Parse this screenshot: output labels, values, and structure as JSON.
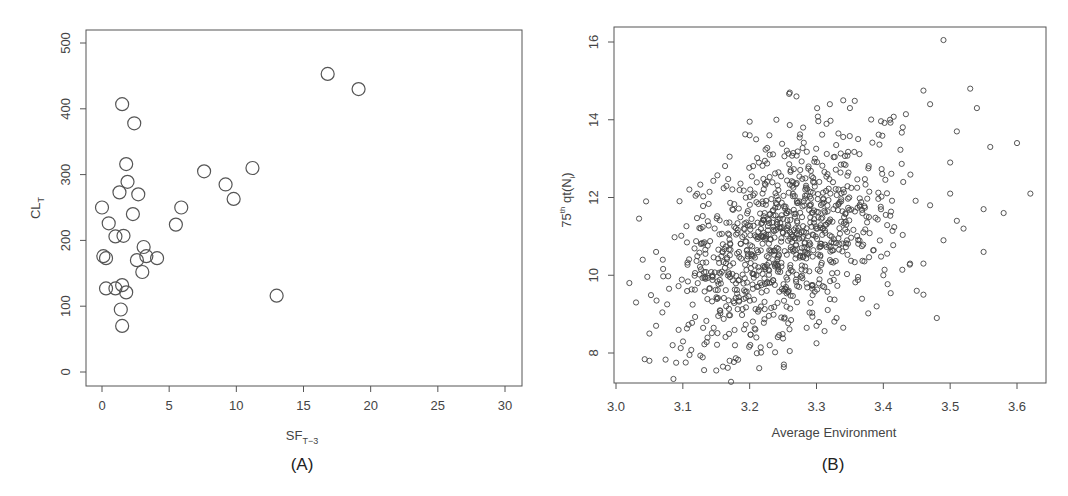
{
  "chart_data": [
    {
      "type": "scatter",
      "panel_label": "(A)",
      "title": "",
      "xlabel": "SF",
      "xlabel_sub": "T−3",
      "ylabel": "CL",
      "ylabel_sub": "T",
      "xlim": [
        -1,
        31.5
      ],
      "ylim": [
        -20,
        520
      ],
      "xticks": [
        0,
        5,
        10,
        15,
        20,
        25,
        30
      ],
      "yticks": [
        0,
        100,
        200,
        300,
        400,
        500
      ],
      "grid": false,
      "legend": null,
      "marker": "open-circle-large",
      "points": [
        [
          16.8,
          453
        ],
        [
          19.1,
          430
        ],
        [
          1.5,
          407
        ],
        [
          2.4,
          378
        ],
        [
          1.8,
          316
        ],
        [
          7.6,
          305
        ],
        [
          11.2,
          310
        ],
        [
          1.9,
          289
        ],
        [
          9.2,
          285
        ],
        [
          1.3,
          273
        ],
        [
          2.7,
          270
        ],
        [
          9.8,
          263
        ],
        [
          0.0,
          250
        ],
        [
          5.9,
          250
        ],
        [
          2.3,
          240
        ],
        [
          0.5,
          226
        ],
        [
          5.5,
          224
        ],
        [
          1.0,
          206
        ],
        [
          1.6,
          207
        ],
        [
          3.1,
          190
        ],
        [
          0.1,
          176
        ],
        [
          0.3,
          173
        ],
        [
          2.6,
          170
        ],
        [
          3.3,
          176
        ],
        [
          4.1,
          173
        ],
        [
          3.0,
          152
        ],
        [
          0.3,
          127
        ],
        [
          1.0,
          127
        ],
        [
          1.5,
          132
        ],
        [
          1.8,
          121
        ],
        [
          13.0,
          116
        ],
        [
          1.4,
          95
        ],
        [
          1.5,
          70
        ]
      ]
    },
    {
      "type": "scatter",
      "panel_label": "(B)",
      "title": "",
      "xlabel": "Average Environment",
      "ylabel_prefix": "75",
      "ylabel_sup": "th",
      "ylabel_main": " qt(N",
      "ylabel_sub": "i",
      "ylabel_suffix": ")",
      "xlim": [
        2.997,
        3.645
      ],
      "ylim": [
        7.25,
        16.4
      ],
      "xticks": [
        3.0,
        3.1,
        3.2,
        3.3,
        3.4,
        3.5,
        3.6
      ],
      "xtick_labels": [
        "3.0",
        "3.1",
        "3.2",
        "3.3",
        "3.4",
        "3.5",
        "3.6"
      ],
      "yticks": [
        8,
        10,
        12,
        14,
        16
      ],
      "grid": false,
      "legend": null,
      "marker": "open-circle-small",
      "approx_total_points": 1000,
      "cloud_model": {
        "x_mean": 3.255,
        "x_sd": 0.085,
        "y_mean": 10.9,
        "y_sd": 1.35,
        "corr": 0.42,
        "n": 960,
        "seed": 7
      },
      "points": [
        [
          3.49,
          16.05
        ],
        [
          3.53,
          14.8
        ],
        [
          3.46,
          14.75
        ],
        [
          3.54,
          14.3
        ],
        [
          3.47,
          14.4
        ],
        [
          3.51,
          13.7
        ],
        [
          3.6,
          13.4
        ],
        [
          3.56,
          13.3
        ],
        [
          3.62,
          12.1
        ],
        [
          3.58,
          11.6
        ],
        [
          3.55,
          11.7
        ],
        [
          3.55,
          10.6
        ],
        [
          3.48,
          8.9
        ],
        [
          3.02,
          9.8
        ],
        [
          3.05,
          7.8
        ],
        [
          3.15,
          7.55
        ],
        [
          3.045,
          11.9
        ],
        [
          3.41,
          14.0
        ],
        [
          3.26,
          14.7
        ],
        [
          3.27,
          14.6
        ],
        [
          3.34,
          14.5
        ],
        [
          3.32,
          14.4
        ],
        [
          3.35,
          14.3
        ],
        [
          3.2,
          13.95
        ],
        [
          3.2,
          13.6
        ],
        [
          3.24,
          14.0
        ],
        [
          3.28,
          13.8
        ],
        [
          3.23,
          13.1
        ],
        [
          3.17,
          13.05
        ],
        [
          3.5,
          12.9
        ],
        [
          3.5,
          12.1
        ],
        [
          3.47,
          11.8
        ],
        [
          3.51,
          11.4
        ],
        [
          3.52,
          11.2
        ],
        [
          3.49,
          10.9
        ],
        [
          3.46,
          10.3
        ],
        [
          3.46,
          9.5
        ],
        [
          3.45,
          9.6
        ],
        [
          3.03,
          9.3
        ],
        [
          3.04,
          10.4
        ],
        [
          3.06,
          10.6
        ],
        [
          3.07,
          10.4
        ],
        [
          3.05,
          8.5
        ],
        [
          3.06,
          8.7
        ],
        [
          3.09,
          7.75
        ],
        [
          3.11,
          7.95
        ],
        [
          3.16,
          7.65
        ],
        [
          3.17,
          7.8
        ],
        [
          3.26,
          8.05
        ],
        [
          3.3,
          8.25
        ],
        [
          3.23,
          8.2
        ],
        [
          3.21,
          8.4
        ],
        [
          3.44,
          10.3
        ],
        [
          3.4,
          10.0
        ],
        [
          3.39,
          9.2
        ],
        [
          3.33,
          8.9
        ],
        [
          3.34,
          8.65
        ],
        [
          3.3,
          8.7
        ]
      ]
    }
  ],
  "panels": {
    "a": {
      "label": "(A)",
      "xlabel": "SF",
      "xlabel_sub": "T−3",
      "ylabel": "CL",
      "ylabel_sub": "T",
      "ytick_labels": [
        "0",
        "100",
        "200",
        "300",
        "400",
        "500"
      ],
      "xtick_labels": [
        "0",
        "5",
        "10",
        "15",
        "20",
        "25",
        "30"
      ]
    },
    "b": {
      "label": "(B)",
      "xlabel": "Average Environment",
      "ylabel_prefix": "75",
      "ylabel_sup": "th",
      "ylabel_main": " qt(N",
      "ylabel_sub": "i",
      "ylabel_suffix": ")",
      "ytick_labels": [
        "8",
        "10",
        "12",
        "14",
        "16"
      ],
      "xtick_labels": [
        "3.0",
        "3.1",
        "3.2",
        "3.3",
        "3.4",
        "3.5",
        "3.6"
      ]
    }
  }
}
